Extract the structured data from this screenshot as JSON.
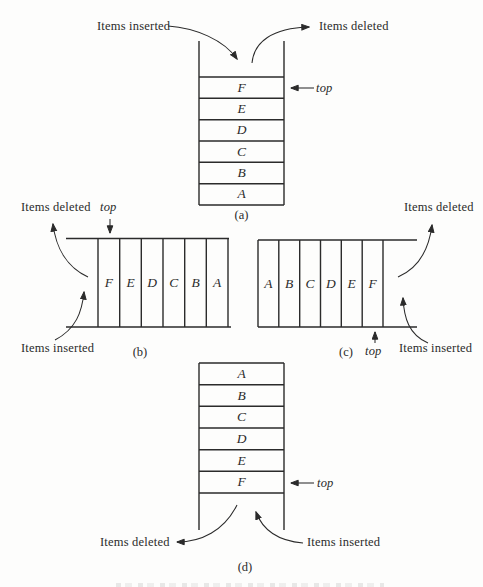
{
  "figure": {
    "labels": {
      "items_inserted": "Items inserted",
      "items_deleted": "Items deleted",
      "top_pointer": "top"
    },
    "diagrams": {
      "a": {
        "caption": "(a)",
        "orientation": "vertical",
        "open_end": "top",
        "cells": [
          "F",
          "E",
          "D",
          "C",
          "B",
          "A"
        ]
      },
      "b": {
        "caption": "(b)",
        "orientation": "horizontal",
        "open_end": "left",
        "cells": [
          "F",
          "E",
          "D",
          "C",
          "B",
          "A"
        ]
      },
      "c": {
        "caption": "(c)",
        "orientation": "horizontal",
        "open_end": "right",
        "cells": [
          "A",
          "B",
          "C",
          "D",
          "E",
          "F"
        ]
      },
      "d": {
        "caption": "(d)",
        "orientation": "vertical",
        "open_end": "bottom",
        "cells": [
          "A",
          "B",
          "C",
          "D",
          "E",
          "F"
        ]
      }
    },
    "colors": {
      "ink": "#2b2b2b",
      "paper": "#fdfdfc"
    }
  }
}
